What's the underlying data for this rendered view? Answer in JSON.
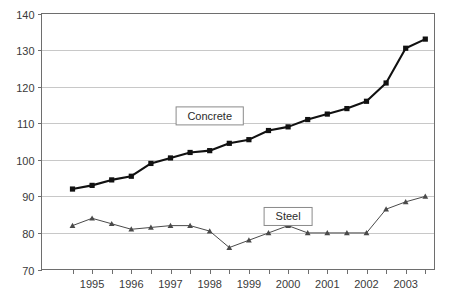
{
  "chart_data": {
    "type": "line",
    "title": "",
    "xlabel": "",
    "ylabel": "",
    "ylim": [
      70,
      140
    ],
    "ytick_values": [
      70,
      80,
      90,
      100,
      110,
      120,
      130,
      140
    ],
    "ytick_labels": [
      "70",
      "80",
      "90",
      "100",
      "110",
      "120",
      "130",
      "140"
    ],
    "grid": true,
    "legend_position": "inline-annotation",
    "xtick_labels": [
      "1995",
      "1996",
      "1997",
      "1998",
      "1999",
      "2000",
      "2001",
      "2002",
      "2003"
    ],
    "x": [
      "1994.5",
      "1995",
      "1995.5",
      "1996",
      "1996.5",
      "1997",
      "1997.5",
      "1998",
      "1998.5",
      "1999",
      "1999.5",
      "2000",
      "2000.5",
      "2001",
      "2001.5",
      "2002",
      "2002.5",
      "2003",
      "2003.5"
    ],
    "series": [
      {
        "name": "Concrete",
        "marker": "square",
        "color": "#111111",
        "values": [
          92,
          93,
          94.5,
          95.5,
          99,
          100.5,
          102,
          102.5,
          104.5,
          105.5,
          108,
          109,
          111,
          112.5,
          114,
          116,
          121,
          130.5,
          133
        ]
      },
      {
        "name": "Steel",
        "marker": "triangle",
        "color": "#4a4a4a",
        "values": [
          82,
          84,
          82.5,
          81,
          81.5,
          82,
          82,
          80.5,
          76,
          78,
          80,
          82,
          80,
          80,
          80,
          80,
          86.5,
          88.5,
          90
        ]
      }
    ],
    "annotations": [
      {
        "label": "Concrete",
        "x_value": "1998",
        "y_value": 112
      },
      {
        "label": "Steel",
        "x_value": "2000",
        "y_value": 84.5
      }
    ]
  }
}
